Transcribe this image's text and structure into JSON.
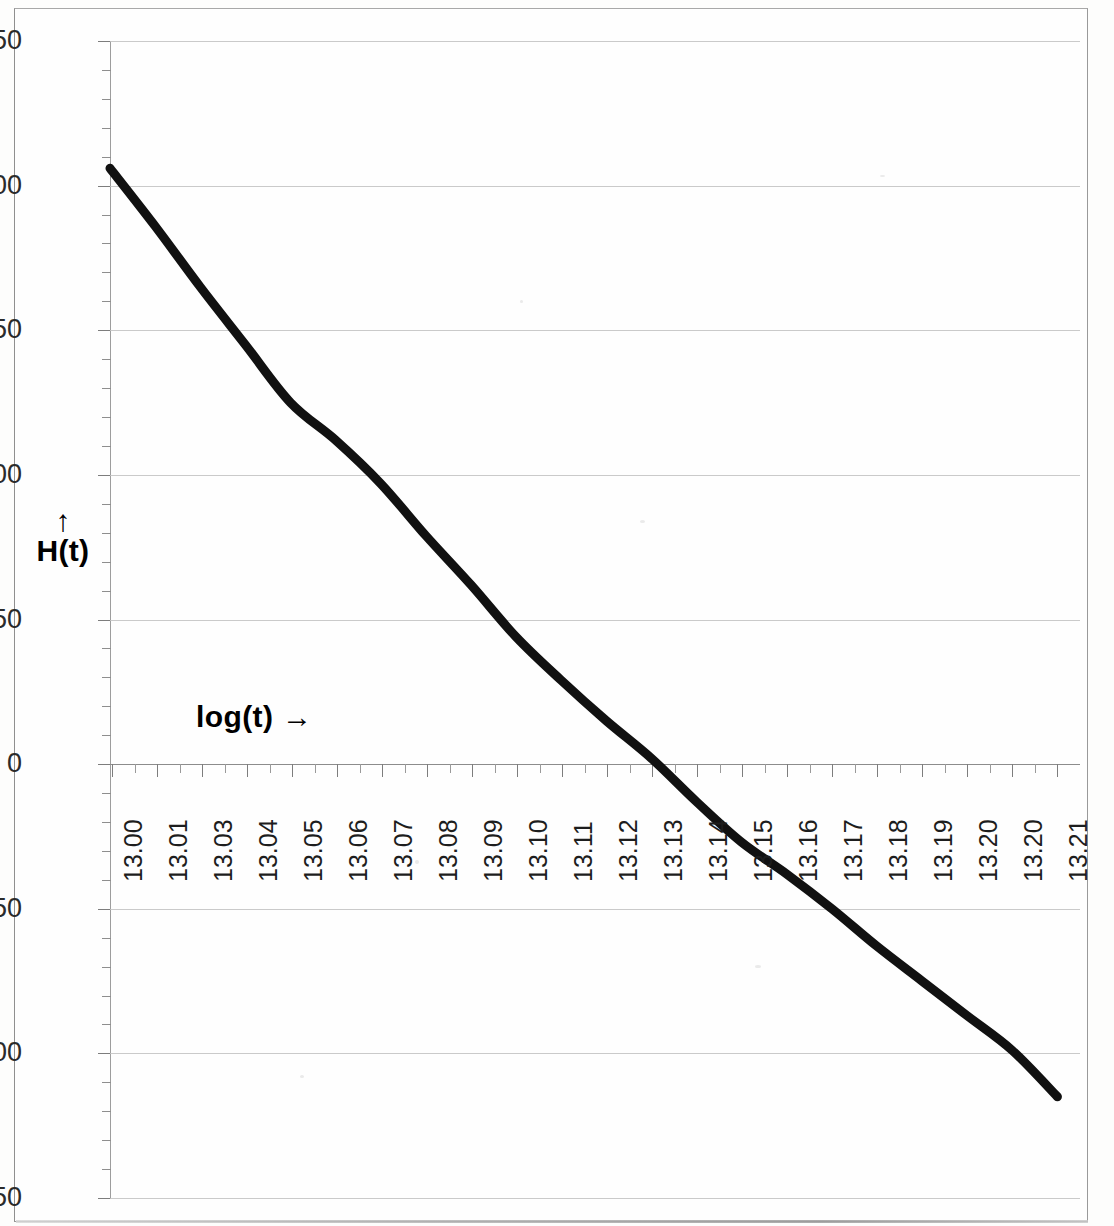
{
  "chart_data": {
    "type": "line",
    "title": "",
    "subtitle": "",
    "xlabel": "log(t) →",
    "ylabel": "H(t)",
    "ylabel_arrow": "↑",
    "xlim": [
      13.0,
      13.215
    ],
    "ylim": [
      -150,
      250
    ],
    "y_ticks": [
      250,
      200,
      150,
      100,
      50,
      0,
      -50,
      -100,
      -150
    ],
    "y_tick_labels": [
      "250",
      "200",
      "150",
      "100",
      "50",
      "0",
      "-50",
      "-100",
      "-150"
    ],
    "y_minor_step": 10,
    "grid": true,
    "legend": "none",
    "x_tick_labels": [
      "13.00",
      "13.01",
      "13.03",
      "13.04",
      "13.05",
      "13.06",
      "13.07",
      "13.08",
      "13.09",
      "13.10",
      "13.11",
      "13.12",
      "13.13",
      "13.14",
      "13.15",
      "13.16",
      "13.17",
      "13.18",
      "13.19",
      "13.20",
      "13.20",
      "13.21"
    ],
    "series": [
      {
        "name": "H(t)",
        "color": "#111111",
        "line_width": 9,
        "x": [
          13.0,
          13.01,
          13.02,
          13.03,
          13.04,
          13.05,
          13.06,
          13.07,
          13.08,
          13.09,
          13.1,
          13.11,
          13.12,
          13.13,
          13.14,
          13.15,
          13.16,
          13.17,
          13.18,
          13.19,
          13.2,
          13.21
        ],
        "values": [
          206,
          186,
          165,
          145,
          125,
          112,
          97,
          79,
          62,
          44,
          29,
          15,
          2,
          -13,
          -27,
          -38,
          -50,
          -63,
          -75,
          -87,
          -99,
          -115
        ]
      }
    ],
    "annotations": []
  },
  "axes": {
    "y_axis_name": "H(t)",
    "x_axis_name": "log(t)"
  },
  "colors": {
    "curve": "#111111",
    "gridline": "#c4c4c4",
    "axis": "#8e8e8e",
    "text": "#1d1d1d",
    "background": "#fefefe",
    "frame": "#9a9a9a"
  }
}
